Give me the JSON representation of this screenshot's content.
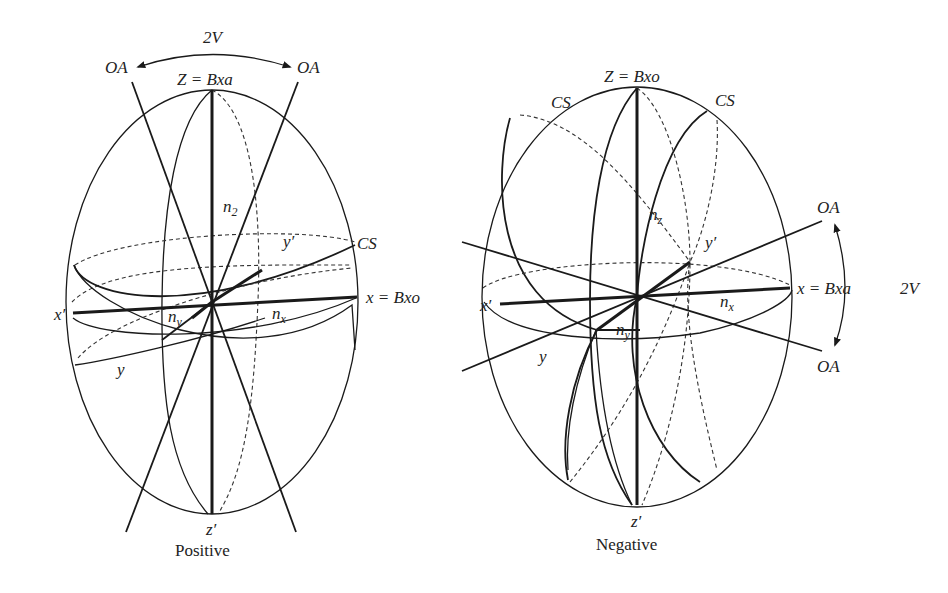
{
  "figure": {
    "colors": {
      "line": "#1a1a1a",
      "background": "#ffffff"
    }
  },
  "positive": {
    "caption": "Positive",
    "angle_label": "2V",
    "optic_axis_left": "OA",
    "optic_axis_right": "OA",
    "z_axis": "Z = Bxa",
    "z_prime": "z′",
    "x_axis": "x = Bxo",
    "x_prime": "x′",
    "y_axis": "y",
    "y_prime": "y′",
    "circular_section": "CS",
    "n_z": "n",
    "n_z_sub": "2",
    "n_y": "n",
    "n_y_sub": "y",
    "n_x": "n",
    "n_x_sub": "x"
  },
  "negative": {
    "caption": "Negative",
    "angle_label": "2V",
    "optic_axis_top": "OA",
    "optic_axis_bottom": "OA",
    "z_axis": "Z = Bxo",
    "z_prime": "z′",
    "x_axis": "x = Bxa",
    "x_prime": "x′",
    "y_axis": "y",
    "y_prime": "y′",
    "circular_section_left": "CS",
    "circular_section_right": "CS",
    "n_z": "n",
    "n_z_sub": "z",
    "n_y": "n",
    "n_y_sub": "y",
    "n_x": "n",
    "n_x_sub": "x"
  }
}
